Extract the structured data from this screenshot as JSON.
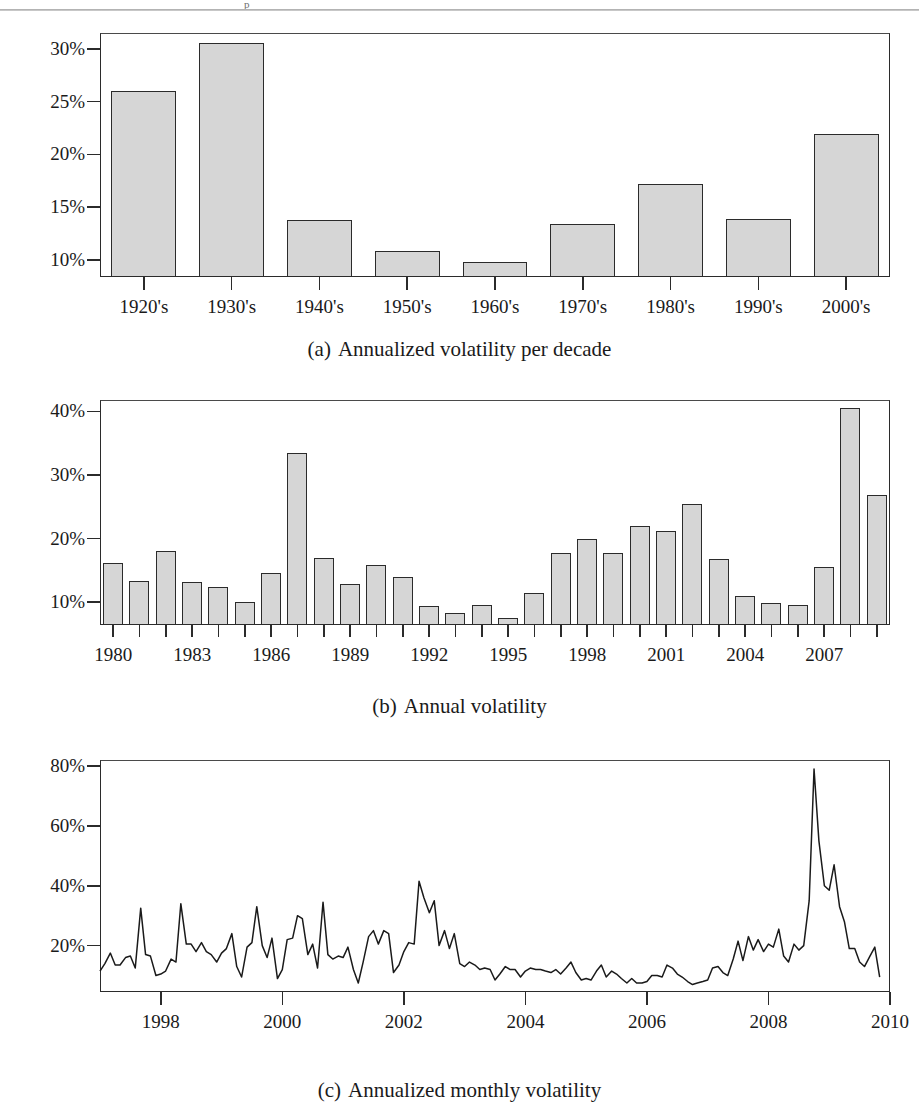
{
  "figure": {
    "top_fragment": "p",
    "panels": [
      {
        "id": "a",
        "caption_label": "(a)",
        "caption_text": "Annualized volatility per decade"
      },
      {
        "id": "b",
        "caption_label": "(b)",
        "caption_text": "Annual volatility"
      },
      {
        "id": "c",
        "caption_label": "(c)",
        "caption_text": "Annualized monthly volatility"
      }
    ]
  },
  "chart_data": [
    {
      "type": "bar",
      "panel": "a",
      "title": "(a) Annualized volatility per decade",
      "xlabel": "",
      "ylabel": "",
      "grid": false,
      "legend": null,
      "ylim": [
        8.4,
        31.5
      ],
      "ytick_labels": [
        "10%",
        "15%",
        "20%",
        "25%",
        "30%"
      ],
      "ytick_values": [
        10,
        15,
        20,
        25,
        30
      ],
      "categories": [
        "1920's",
        "1930's",
        "1940's",
        "1950's",
        "1960's",
        "1970's",
        "1980's",
        "1990's",
        "2000's"
      ],
      "values": [
        26.0,
        30.6,
        13.8,
        10.9,
        9.8,
        13.4,
        17.2,
        13.9,
        21.9
      ]
    },
    {
      "type": "bar",
      "panel": "b",
      "title": "(b) Annual volatility",
      "xlabel": "",
      "ylabel": "",
      "grid": false,
      "legend": null,
      "ylim": [
        6.4,
        41.8
      ],
      "ytick_labels": [
        "10%",
        "20%",
        "30%",
        "40%"
      ],
      "ytick_values": [
        10,
        20,
        30,
        40
      ],
      "xtick_labels": [
        "1980",
        "1983",
        "1986",
        "1989",
        "1992",
        "1995",
        "1998",
        "2001",
        "2004",
        "2007"
      ],
      "xtick_values": [
        1980,
        1983,
        1986,
        1989,
        1992,
        1995,
        1998,
        2001,
        2004,
        2007
      ],
      "categories": [
        1980,
        1981,
        1982,
        1983,
        1984,
        1985,
        1986,
        1987,
        1988,
        1989,
        1990,
        1991,
        1992,
        1993,
        1994,
        1995,
        1996,
        1997,
        1998,
        1999,
        2000,
        2001,
        2002,
        2003,
        2004,
        2005,
        2006,
        2007,
        2008,
        2009
      ],
      "values": [
        16.2,
        13.3,
        18.0,
        13.1,
        12.4,
        10.0,
        14.6,
        33.4,
        17.0,
        12.9,
        15.8,
        14.0,
        9.4,
        8.3,
        9.6,
        7.5,
        11.4,
        17.8,
        20.0,
        17.7,
        21.9,
        21.2,
        25.5,
        16.8,
        10.9,
        9.9,
        9.5,
        15.6,
        40.5,
        26.8
      ]
    },
    {
      "type": "line",
      "panel": "c",
      "title": "(c) Annualized monthly volatility",
      "xlabel": "",
      "ylabel": "",
      "grid": false,
      "legend": null,
      "xlim": [
        1997.0,
        2010.0
      ],
      "ylim": [
        4.5,
        82.0
      ],
      "ytick_labels": [
        "20%",
        "40%",
        "60%",
        "80%"
      ],
      "ytick_values": [
        20,
        40,
        60,
        80
      ],
      "xtick_labels": [
        "1998",
        "2000",
        "2002",
        "2004",
        "2006",
        "2008",
        "2010"
      ],
      "xtick_values": [
        1998,
        2000,
        2002,
        2004,
        2006,
        2008,
        2010
      ],
      "x": [
        1997.0,
        1997.08,
        1997.17,
        1997.25,
        1997.33,
        1997.42,
        1997.5,
        1997.58,
        1997.67,
        1997.75,
        1997.83,
        1997.92,
        1998.0,
        1998.08,
        1998.17,
        1998.25,
        1998.33,
        1998.42,
        1998.5,
        1998.58,
        1998.67,
        1998.75,
        1998.83,
        1998.92,
        1999.0,
        1999.08,
        1999.17,
        1999.25,
        1999.33,
        1999.42,
        1999.5,
        1999.58,
        1999.67,
        1999.75,
        1999.83,
        1999.92,
        2000.0,
        2000.08,
        2000.17,
        2000.25,
        2000.33,
        2000.42,
        2000.5,
        2000.58,
        2000.67,
        2000.75,
        2000.83,
        2000.92,
        2001.0,
        2001.08,
        2001.17,
        2001.25,
        2001.33,
        2001.42,
        2001.5,
        2001.58,
        2001.67,
        2001.75,
        2001.83,
        2001.92,
        2002.0,
        2002.08,
        2002.17,
        2002.25,
        2002.33,
        2002.42,
        2002.5,
        2002.58,
        2002.67,
        2002.75,
        2002.83,
        2002.92,
        2003.0,
        2003.08,
        2003.17,
        2003.25,
        2003.33,
        2003.42,
        2003.5,
        2003.58,
        2003.67,
        2003.75,
        2003.83,
        2003.92,
        2004.0,
        2004.08,
        2004.17,
        2004.25,
        2004.33,
        2004.42,
        2004.5,
        2004.58,
        2004.67,
        2004.75,
        2004.83,
        2004.92,
        2005.0,
        2005.08,
        2005.17,
        2005.25,
        2005.33,
        2005.42,
        2005.5,
        2005.58,
        2005.67,
        2005.75,
        2005.83,
        2005.92,
        2006.0,
        2006.08,
        2006.17,
        2006.25,
        2006.33,
        2006.42,
        2006.5,
        2006.58,
        2006.67,
        2006.75,
        2006.83,
        2006.92,
        2007.0,
        2007.08,
        2007.17,
        2007.25,
        2007.33,
        2007.42,
        2007.5,
        2007.58,
        2007.67,
        2007.75,
        2007.83,
        2007.92,
        2008.0,
        2008.08,
        2008.17,
        2008.25,
        2008.33,
        2008.42,
        2008.5,
        2008.58,
        2008.67,
        2008.75,
        2008.83,
        2008.92,
        2009.0,
        2009.08,
        2009.17,
        2009.25,
        2009.33,
        2009.42,
        2009.5,
        2009.58,
        2009.67,
        2009.75,
        2009.83
      ],
      "y": [
        11.5,
        14.0,
        17.5,
        13.5,
        13.5,
        16.0,
        16.5,
        12.5,
        32.5,
        17.0,
        16.5,
        10.0,
        10.5,
        11.5,
        15.5,
        14.5,
        34.0,
        20.5,
        20.5,
        18.0,
        21.0,
        18.0,
        17.0,
        14.5,
        17.5,
        19.0,
        24.0,
        13.0,
        9.5,
        19.5,
        21.0,
        33.0,
        20.0,
        16.0,
        22.5,
        9.0,
        12.0,
        22.0,
        22.5,
        30.0,
        29.0,
        17.0,
        20.5,
        12.5,
        34.5,
        17.0,
        15.5,
        16.5,
        16.0,
        19.5,
        12.0,
        7.5,
        14.5,
        23.0,
        25.0,
        20.5,
        25.0,
        24.0,
        11.0,
        13.5,
        18.0,
        21.0,
        20.5,
        41.5,
        36.0,
        31.0,
        35.0,
        20.0,
        25.0,
        19.0,
        24.0,
        14.0,
        13.0,
        14.5,
        13.5,
        12.0,
        12.5,
        12.0,
        8.5,
        10.5,
        13.0,
        12.0,
        12.0,
        9.5,
        11.5,
        12.5,
        12.0,
        12.0,
        11.5,
        11.0,
        12.0,
        10.5,
        12.5,
        14.5,
        11.0,
        8.5,
        9.0,
        8.5,
        11.5,
        13.5,
        9.5,
        11.5,
        10.5,
        9.0,
        7.5,
        9.0,
        7.5,
        7.5,
        8.0,
        10.0,
        10.0,
        9.5,
        13.5,
        12.5,
        10.5,
        9.5,
        8.0,
        7.0,
        7.5,
        8.0,
        8.5,
        12.5,
        13.0,
        11.0,
        10.0,
        15.5,
        21.5,
        15.0,
        23.0,
        18.5,
        22.0,
        18.0,
        20.5,
        19.5,
        25.5,
        16.5,
        14.5,
        20.5,
        18.5,
        20.0,
        35.0,
        79.0,
        55.0,
        40.0,
        38.5,
        47.0,
        33.0,
        28.0,
        19.0,
        19.0,
        14.5,
        13.0,
        16.5,
        19.5,
        9.5
      ]
    }
  ]
}
